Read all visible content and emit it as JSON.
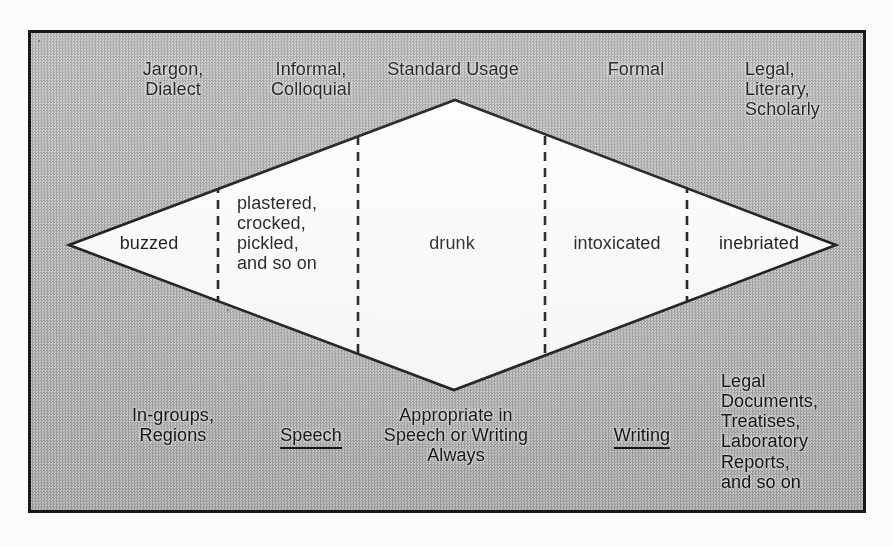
{
  "figure": {
    "type": "diamond-continuum-diagram",
    "frame": {
      "border_color": "#17191a",
      "background": "#bdbdbd",
      "interior_fill": "#ffffff"
    }
  },
  "top_labels": [
    {
      "id": "jargon-dialect",
      "text": "Jargon,\nDialect"
    },
    {
      "id": "informal-colloquial",
      "text": "Informal,\nColloquial"
    },
    {
      "id": "standard-usage",
      "text": "Standard Usage"
    },
    {
      "id": "formal",
      "text": "Formal"
    },
    {
      "id": "legal-literary-scholarly",
      "text": "Legal,\nLiterary,\nScholarly"
    }
  ],
  "diamond_cells": [
    {
      "id": "buzzed",
      "text": "buzzed"
    },
    {
      "id": "plastered",
      "text": "plastered,\ncrocked,\npickled,\nand so on"
    },
    {
      "id": "drunk",
      "text": "drunk"
    },
    {
      "id": "intoxicated",
      "text": "intoxicated"
    },
    {
      "id": "inebriated",
      "text": "inebriated"
    }
  ],
  "bottom_labels": [
    {
      "id": "in-groups-regions",
      "text": "In-groups,\nRegions",
      "underline": false
    },
    {
      "id": "speech",
      "text": "Speech",
      "underline": true
    },
    {
      "id": "appropriate",
      "text": "Appropriate in\nSpeech or Writing\nAlways",
      "underline": false
    },
    {
      "id": "writing",
      "text": "Writing",
      "underline": true
    },
    {
      "id": "legal-documents",
      "text": "Legal\nDocuments,\nTreatises,\nLaboratory\nReports,\nand so on",
      "underline": false
    }
  ],
  "geometry": {
    "vertices": {
      "left": [
        66,
        242
      ],
      "top": [
        452,
        97
      ],
      "right": [
        833,
        242
      ],
      "bottom": [
        451,
        387
      ]
    },
    "divider_x": [
      215,
      355,
      542,
      684
    ]
  }
}
